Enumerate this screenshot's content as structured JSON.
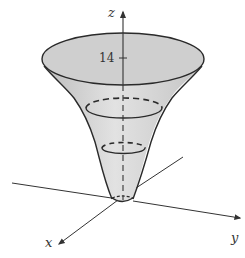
{
  "diagram": {
    "axes": {
      "x_label": "x",
      "y_label": "y",
      "z_label": "z"
    },
    "z_tick": {
      "label": "14"
    },
    "colors": {
      "surface_fill": "#d4d4d4",
      "top_fill": "#cfcfcf",
      "stroke": "#2a2a2a",
      "axis": "#333333",
      "background": "#ffffff"
    },
    "cross_sections": [
      {
        "name": "top-rim",
        "style": "solid"
      },
      {
        "name": "middle-section",
        "style": "dashed-back-solid-front"
      },
      {
        "name": "lower-section",
        "style": "dashed-back-solid-front"
      }
    ]
  }
}
